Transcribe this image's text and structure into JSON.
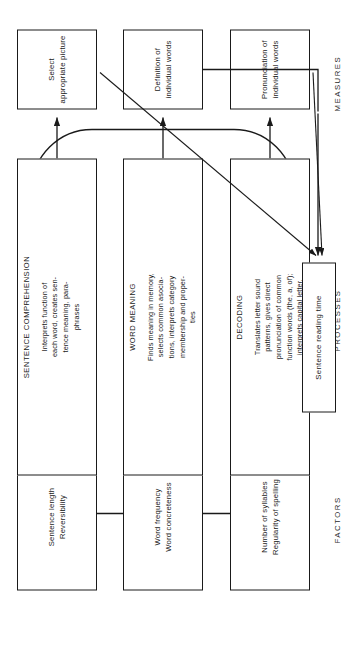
{
  "diagram": {
    "orientation": "rotated-90-ccw",
    "columns": [
      {
        "key": "factors",
        "caption": "FACTORS"
      },
      {
        "key": "processes",
        "caption": "PROCESSES"
      },
      {
        "key": "measures",
        "caption": "MEASURES"
      }
    ],
    "colors": {
      "stroke": "#1a1a1a",
      "background": "#ffffff",
      "text": "#1a1a1a"
    }
  },
  "factors": [
    {
      "id": "factor-decoding",
      "lines": [
        "Number of syllables",
        "Regularity of spelling"
      ]
    },
    {
      "id": "factor-word-meaning",
      "lines": [
        "Word frequency",
        "Word concreteness"
      ]
    },
    {
      "id": "factor-sentence-comprehension",
      "lines": [
        "Sentence length",
        "Reversibility"
      ]
    }
  ],
  "processes": [
    {
      "id": "process-decoding",
      "title": "DECODING",
      "body_lines": [
        "Translates letter sound",
        "patterns, gives direct",
        "pronunciation of common",
        "function words (the, a, of);",
        "interprets capital letter,",
        "periods, paragraph inden-",
        "tations, and so on"
      ],
      "body_text": "Translates letter sound patterns, gives direct pronunciation of common function words (the, a, of); interprets capital letter, periods, paragraph indentations, and so on"
    },
    {
      "id": "process-word-meaning",
      "title": "WORD MEANING",
      "body_lines": [
        "Finds meaning in memory,",
        "selects common asocia-",
        "tions, interprets category",
        "membership and proper-",
        "ties"
      ],
      "body_text": "Finds meaning in memory, selects common asociations, interprets category membership and properties"
    },
    {
      "id": "process-sentence-comprehension",
      "title": "SENTENCE COMPREHENSION",
      "body_lines": [
        "Interprets function of",
        "each word, creates sen-",
        "tence meaning, para-",
        "phrases"
      ],
      "body_text": "Interprets function of each word, creates sentence meaning, paraphrases"
    }
  ],
  "measures": [
    {
      "id": "measure-pronunciation",
      "lines": [
        "Pronunciation of",
        "individual words"
      ]
    },
    {
      "id": "measure-definition",
      "lines": [
        "Definition of",
        "individual words"
      ]
    },
    {
      "id": "measure-select-picture",
      "lines": [
        "Select",
        "appropriate picture"
      ]
    }
  ],
  "outcome": {
    "id": "outcome-sentence-reading-time",
    "lines": [
      "Sentence reading time"
    ]
  }
}
